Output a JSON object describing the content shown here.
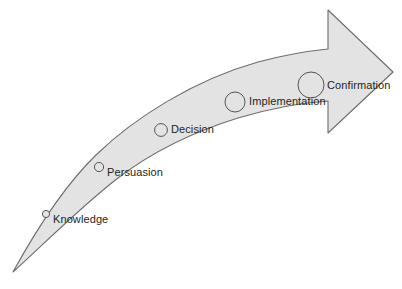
{
  "diagram": {
    "type": "curved-arrow-stage-diagram",
    "direction": "left-to-right-ascending",
    "colors": {
      "arrow_fill": "#e3e3e3",
      "arrow_stroke": "#6d6d6d",
      "marker_stroke": "#555555",
      "marker_fill": "#e3e3e3",
      "label_text": "#231f20",
      "background": "#ffffff"
    },
    "stages": [
      {
        "id": "knowledge",
        "label": "Knowledge",
        "order": 1,
        "marker_radius": 3.6,
        "marker_cx": 46,
        "marker_cy": 214,
        "label_x": 53,
        "label_y": 214
      },
      {
        "id": "persuasion",
        "label": "Persuasion",
        "order": 2,
        "marker_radius": 4.6,
        "marker_cx": 99,
        "marker_cy": 167,
        "label_x": 107,
        "label_y": 172
      },
      {
        "id": "decision",
        "label": "Decision",
        "order": 3,
        "marker_radius": 6.4,
        "marker_cx": 161,
        "marker_cy": 130,
        "label_x": 171,
        "label_y": 134
      },
      {
        "id": "implementation",
        "label": "Implementation",
        "order": 4,
        "marker_radius": 10.0,
        "marker_cx": 235,
        "marker_cy": 102,
        "label_x": 249,
        "label_y": 104
      },
      {
        "id": "confirmation",
        "label": "Confirmation",
        "order": 5,
        "marker_radius": 13.0,
        "marker_cx": 311,
        "marker_cy": 85,
        "label_x": 327,
        "label_y": 87
      }
    ]
  }
}
